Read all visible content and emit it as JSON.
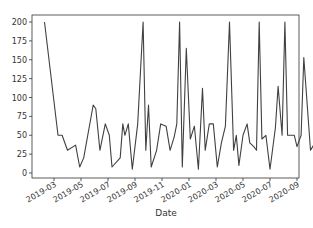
{
  "chart_data": {
    "type": "line",
    "title": "",
    "xlabel": "Date",
    "ylabel": "",
    "ylim": [
      -8,
      208
    ],
    "grid": false,
    "legend": null,
    "line_color": "#404040",
    "yticks": [
      0,
      25,
      50,
      75,
      100,
      125,
      150,
      175,
      200
    ],
    "xticks": [
      "2019-03",
      "2019-05",
      "2019-07",
      "2019-09",
      "2019-11",
      "2020-01",
      "2020-03",
      "2020-05",
      "2020-07",
      "2020-09"
    ],
    "x_months_offset": "months since 2019-03-01",
    "series": [
      {
        "name": "value",
        "points": [
          [
            -0.7,
            200
          ],
          [
            0.3,
            50
          ],
          [
            0.6,
            50
          ],
          [
            1.0,
            30
          ],
          [
            1.6,
            37
          ],
          [
            1.9,
            8
          ],
          [
            2.2,
            20
          ],
          [
            2.9,
            90
          ],
          [
            3.1,
            85
          ],
          [
            3.4,
            30
          ],
          [
            3.8,
            65
          ],
          [
            4.1,
            50
          ],
          [
            4.3,
            8
          ],
          [
            4.9,
            20
          ],
          [
            5.1,
            65
          ],
          [
            5.25,
            50
          ],
          [
            5.5,
            65
          ],
          [
            5.8,
            5
          ],
          [
            6.2,
            65
          ],
          [
            6.6,
            200
          ],
          [
            6.8,
            30
          ],
          [
            7.0,
            90
          ],
          [
            7.2,
            8
          ],
          [
            7.6,
            30
          ],
          [
            7.9,
            65
          ],
          [
            8.3,
            62
          ],
          [
            8.6,
            30
          ],
          [
            8.9,
            48
          ],
          [
            9.1,
            65
          ],
          [
            9.3,
            200
          ],
          [
            9.5,
            8
          ],
          [
            9.8,
            165
          ],
          [
            10.1,
            45
          ],
          [
            10.4,
            62
          ],
          [
            10.7,
            5
          ],
          [
            11.0,
            112
          ],
          [
            11.2,
            30
          ],
          [
            11.5,
            65
          ],
          [
            11.8,
            65
          ],
          [
            12.1,
            8
          ],
          [
            12.4,
            40
          ],
          [
            12.7,
            62
          ],
          [
            13.0,
            200
          ],
          [
            13.3,
            30
          ],
          [
            13.5,
            50
          ],
          [
            13.7,
            10
          ],
          [
            14.0,
            50
          ],
          [
            14.3,
            65
          ],
          [
            14.5,
            40
          ],
          [
            14.8,
            35
          ],
          [
            15.0,
            30
          ],
          [
            15.2,
            200
          ],
          [
            15.4,
            45
          ],
          [
            15.7,
            50
          ],
          [
            16.0,
            5
          ],
          [
            16.4,
            60
          ],
          [
            16.6,
            115
          ],
          [
            16.9,
            50
          ],
          [
            17.1,
            200
          ],
          [
            17.3,
            50
          ],
          [
            17.8,
            50
          ],
          [
            18.0,
            35
          ],
          [
            18.3,
            50
          ],
          [
            18.5,
            153
          ],
          [
            19.0,
            30
          ],
          [
            19.5,
            45
          ],
          [
            19.8,
            50
          ],
          [
            20.8,
            120
          ],
          [
            21.1,
            10
          ],
          [
            21.3,
            5
          ],
          [
            21.5,
            50
          ],
          [
            21.7,
            30
          ],
          [
            21.9,
            50
          ],
          [
            22.1,
            8
          ],
          [
            22.3,
            48
          ],
          [
            22.5,
            32
          ],
          [
            22.9,
            32
          ],
          [
            23.2,
            62
          ],
          [
            23.4,
            10
          ],
          [
            23.7,
            50
          ],
          [
            23.9,
            65
          ],
          [
            24.1,
            90
          ],
          [
            24.3,
            55
          ],
          [
            24.5,
            145
          ],
          [
            24.7,
            30
          ],
          [
            24.9,
            50
          ]
        ]
      }
    ]
  }
}
